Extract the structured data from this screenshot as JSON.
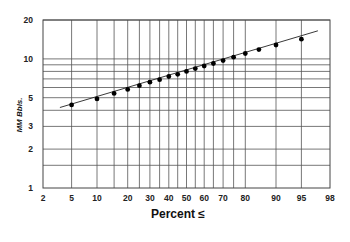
{
  "chart_data": {
    "type": "scatter",
    "title": "",
    "xlabel": "Percent ≤",
    "ylabel": "MM Bbls.",
    "x_scale": "normal-probability",
    "y_scale": "log",
    "xlim": [
      2,
      98
    ],
    "ylim": [
      1,
      20
    ],
    "x_ticks": [
      2,
      5,
      10,
      20,
      30,
      40,
      50,
      60,
      70,
      80,
      90,
      95,
      98
    ],
    "y_ticks": [
      1,
      2,
      3,
      5,
      10,
      20
    ],
    "y_gridlines": [
      1.5,
      2,
      3,
      4,
      5,
      6,
      7,
      8,
      9,
      10,
      20
    ],
    "grid": true,
    "legend": "none",
    "series": [
      {
        "name": "observed",
        "marker": "filled-circle",
        "x": [
          5,
          10,
          15,
          20,
          25,
          30,
          35,
          40,
          45,
          50,
          55,
          60,
          65,
          70,
          75,
          80,
          85,
          90,
          95
        ],
        "y": [
          4.4,
          4.9,
          5.4,
          5.8,
          6.2,
          6.6,
          6.9,
          7.3,
          7.6,
          8.0,
          8.4,
          8.8,
          9.2,
          9.7,
          10.3,
          11.0,
          11.8,
          12.8,
          14.2
        ]
      },
      {
        "name": "fitted-line",
        "type": "line",
        "x": [
          3.5,
          97
        ],
        "y": [
          4.2,
          16.5
        ]
      }
    ]
  }
}
